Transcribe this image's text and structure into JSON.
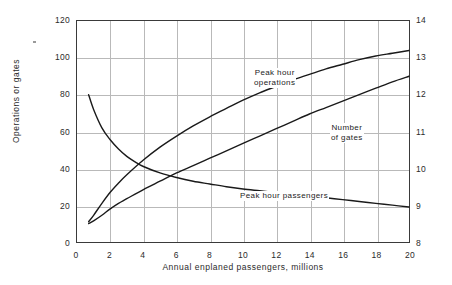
{
  "figure": {
    "background_color": "#ffffff",
    "frame_color": "#3a3a3a",
    "grid_color": "#b9b9b9",
    "curve_color": "#1a1a1a"
  },
  "chart_data": {
    "type": "line",
    "title": "",
    "xlabel": "Annual enplaned passengers, millions",
    "ylabel": "Operations or gates",
    "ylabel_secondary": "Percentage of daily passengers in peak hour",
    "xlim": [
      0,
      20
    ],
    "ylim": [
      0,
      120
    ],
    "ylim_secondary": [
      8,
      14
    ],
    "grid": true,
    "legend": "inline-annotations",
    "xticks": [
      0,
      2,
      4,
      6,
      8,
      10,
      12,
      14,
      16,
      18,
      20
    ],
    "xtick_labels": [
      "0",
      "2",
      "4",
      "6",
      "8",
      "10",
      "12",
      "14",
      "16",
      "18",
      "20"
    ],
    "yticks": [
      0,
      20,
      40,
      60,
      80,
      100,
      120
    ],
    "ytick_labels": [
      "0",
      "20",
      "40",
      "60",
      "80",
      "100",
      "120"
    ],
    "yticks_secondary": [
      8,
      9,
      10,
      11,
      12,
      13,
      14
    ],
    "ytick_labels_secondary": [
      "8",
      "9",
      "10",
      "11",
      "12",
      "13",
      "14"
    ],
    "series": [
      {
        "name": "Peak hour operations",
        "axis": "left",
        "x": [
          0.7,
          1,
          1.5,
          2,
          2.5,
          3,
          4,
          5,
          6,
          7,
          8,
          9,
          10,
          11,
          12,
          13,
          14,
          15,
          16,
          17,
          18,
          19,
          20
        ],
        "values": [
          11,
          14.5,
          21,
          27,
          32,
          36.5,
          44.5,
          51.5,
          57.5,
          63,
          68,
          72.5,
          77,
          81,
          84.5,
          88,
          91,
          94,
          96.5,
          99,
          101,
          102.5,
          104
        ]
      },
      {
        "name": "Number of gates",
        "axis": "left",
        "x": [
          0.7,
          1,
          1.5,
          2,
          2.5,
          3,
          4,
          5,
          6,
          7,
          8,
          9,
          10,
          11,
          12,
          13,
          14,
          15,
          16,
          17,
          18,
          19,
          20
        ],
        "values": [
          10,
          11.5,
          14.5,
          18,
          21,
          23.5,
          28.5,
          33,
          37.5,
          41.5,
          45.5,
          49.5,
          53.5,
          57.5,
          61.5,
          65.5,
          69.5,
          73,
          76.5,
          80,
          83.5,
          87,
          90
        ]
      },
      {
        "name": "Peak hour passengers",
        "axis": "right",
        "x": [
          0.7,
          1,
          1.5,
          2,
          2.5,
          3,
          3.5,
          4,
          5,
          6,
          7,
          8,
          9,
          10,
          11,
          12,
          13,
          14,
          15,
          16,
          17,
          18,
          19,
          20
        ],
        "values_left_scale": [
          80,
          72,
          62,
          55.5,
          50.5,
          46.5,
          43.5,
          41,
          37.5,
          35,
          33,
          31.5,
          30,
          28.8,
          27.8,
          26.8,
          25.8,
          25,
          24,
          23,
          22,
          21,
          20,
          19
        ],
        "values": [
          12.0,
          11.6,
          11.1,
          10.78,
          10.53,
          10.33,
          10.18,
          10.05,
          9.88,
          9.75,
          9.65,
          9.58,
          9.5,
          9.44,
          9.39,
          9.34,
          9.29,
          9.25,
          9.2,
          9.15,
          9.1,
          9.05,
          9.0,
          8.95
        ]
      }
    ],
    "annotations": [
      {
        "text": "Peak hour operations",
        "lines": [
          "Peak hour",
          "operations"
        ]
      },
      {
        "text": "Number of gates",
        "lines": [
          "Number",
          "of gates"
        ]
      },
      {
        "text": "Peak hour passengers",
        "lines": [
          "Peak hour passengers"
        ]
      }
    ]
  }
}
